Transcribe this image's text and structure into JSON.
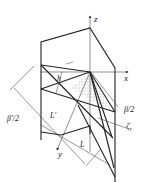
{
  "figure": {
    "axes": {
      "z_label": "z",
      "x_label": "x",
      "y_label": "y"
    },
    "labels": {
      "h": "h",
      "beta_half": "β/2",
      "beta_prime_half": "β′/2",
      "L_prime": "L′",
      "L": "L",
      "zeta": "ζ",
      "zeta_sub": "r"
    },
    "colors": {
      "line": "#222222",
      "background": "#ffffff"
    }
  }
}
